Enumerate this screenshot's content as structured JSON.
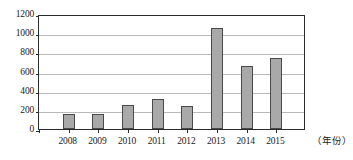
{
  "chart_data": {
    "type": "bar",
    "title": "",
    "subtitle": "",
    "xlabel": "（年份）",
    "ylabel": "",
    "categories": [
      "2008",
      "2009",
      "2010",
      "2011",
      "2012",
      "2013",
      "2014",
      "2015"
    ],
    "values": [
      155,
      160,
      250,
      315,
      245,
      1050,
      655,
      740
    ],
    "series": [
      {
        "name": "",
        "values": [
          155,
          160,
          250,
          315,
          245,
          1050,
          655,
          740
        ]
      }
    ],
    "ylim": [
      0,
      1200
    ],
    "yticks": [
      0,
      200,
      400,
      600,
      800,
      1000,
      1200
    ],
    "ytick_labels": [
      "0",
      "200",
      "400",
      "600",
      "800",
      "1000",
      "1200"
    ],
    "grid": true,
    "grid_axis": "y",
    "legend": false,
    "legend_position": "none",
    "bar_fill_color": "#a9a9a9",
    "bar_edge_color": "#4a4a4a",
    "axis_color": "#2b2b2b",
    "grid_color": "#b9b9b9",
    "background_color": "#ffffff"
  }
}
